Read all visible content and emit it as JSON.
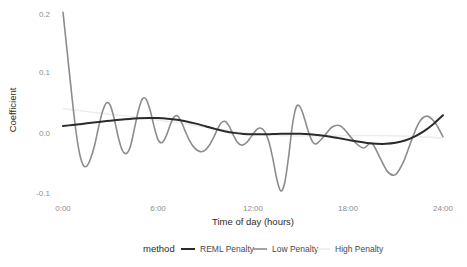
{
  "chart_data": {
    "type": "line",
    "title": "",
    "xlabel": "Time of day (hours)",
    "ylabel": "Coefficient",
    "xlim": [
      0,
      24
    ],
    "ylim": [
      -0.12,
      0.215
    ],
    "grid": false,
    "legend_position": "bottom",
    "legend_title": "method",
    "xticks": [
      0,
      6,
      12,
      18,
      24
    ],
    "xticklabels": [
      "0:00",
      "6:00",
      "12:00",
      "18:00",
      "24:00"
    ],
    "yticks": [
      -0.1,
      0.0,
      0.1,
      0.2
    ],
    "yticklabels": [
      "-0.1",
      "0.0",
      "0.1",
      "0.2"
    ],
    "series": [
      {
        "name": "REML Penalty",
        "color": "#2b2b2b",
        "width": 2.0,
        "x": [
          0.0,
          0.6,
          1.2,
          1.8,
          2.4,
          3.0,
          3.6,
          4.2,
          4.8,
          5.4,
          6.0,
          6.6,
          7.2,
          7.8,
          8.4,
          9.0,
          9.6,
          10.2,
          10.8,
          11.4,
          12.0,
          12.6,
          13.2,
          13.8,
          14.4,
          15.0,
          15.6,
          16.2,
          16.8,
          17.4,
          18.0,
          18.6,
          19.2,
          19.8,
          20.4,
          21.0,
          21.6,
          22.2,
          22.8,
          23.4,
          24.0
        ],
        "y": [
          0.0115,
          0.0133,
          0.0151,
          0.0169,
          0.0187,
          0.0205,
          0.0221,
          0.0234,
          0.0243,
          0.0248,
          0.0247,
          0.0238,
          0.022,
          0.0192,
          0.0155,
          0.0112,
          0.0068,
          0.003,
          0.0002,
          -0.0015,
          -0.0022,
          -0.0022,
          -0.0018,
          -0.0013,
          -0.0011,
          -0.0013,
          -0.0021,
          -0.0036,
          -0.0058,
          -0.0085,
          -0.0114,
          -0.0142,
          -0.0165,
          -0.0179,
          -0.018,
          -0.0163,
          -0.0124,
          -0.006,
          0.0031,
          0.015,
          0.0295
        ]
      },
      {
        "name": "Low Penalty",
        "color": "#8c8c8c",
        "width": 1.6,
        "x": [
          0.0,
          0.25,
          0.5,
          0.75,
          1.0,
          1.25,
          1.5,
          1.75,
          2.0,
          2.25,
          2.5,
          2.75,
          3.0,
          3.25,
          3.5,
          3.75,
          4.0,
          4.25,
          4.5,
          4.75,
          5.0,
          5.25,
          5.5,
          5.75,
          6.0,
          6.25,
          6.5,
          6.75,
          7.0,
          7.25,
          7.5,
          7.75,
          8.0,
          8.25,
          8.5,
          8.75,
          9.0,
          9.25,
          9.5,
          9.75,
          10.0,
          10.25,
          10.5,
          10.75,
          11.0,
          11.25,
          11.5,
          11.75,
          12.0,
          12.25,
          12.5,
          12.75,
          13.0,
          13.25,
          13.5,
          13.75,
          14.0,
          14.25,
          14.5,
          14.75,
          15.0,
          15.25,
          15.5,
          15.75,
          16.0,
          16.5,
          17.0,
          17.5,
          18.0,
          18.5,
          19.0,
          19.5,
          20.0,
          20.5,
          21.0,
          21.5,
          22.0,
          22.5,
          23.0,
          23.5,
          24.0
        ],
        "y": [
          0.2,
          0.138,
          0.076,
          0.017,
          -0.028,
          -0.052,
          -0.055,
          -0.042,
          -0.02,
          0.01,
          0.036,
          0.05,
          0.045,
          0.022,
          -0.008,
          -0.029,
          -0.034,
          -0.023,
          0.006,
          0.036,
          0.056,
          0.056,
          0.038,
          0.011,
          -0.011,
          -0.016,
          -0.006,
          0.012,
          0.026,
          0.028,
          0.017,
          0.001,
          -0.013,
          -0.023,
          -0.029,
          -0.031,
          -0.028,
          -0.02,
          -0.008,
          0.006,
          0.017,
          0.019,
          0.011,
          -0.003,
          -0.015,
          -0.02,
          -0.018,
          -0.011,
          -0.002,
          0.006,
          0.008,
          0.002,
          -0.014,
          -0.042,
          -0.076,
          -0.096,
          -0.083,
          -0.039,
          0.015,
          0.044,
          0.042,
          0.024,
          0.002,
          -0.014,
          -0.018,
          -0.005,
          0.01,
          0.012,
          -0.001,
          -0.017,
          -0.025,
          -0.017,
          -0.04,
          -0.064,
          -0.069,
          -0.048,
          -0.013,
          0.018,
          0.028,
          0.017,
          -0.006
        ]
      },
      {
        "name": "High Penalty",
        "color": "#ededed",
        "width": 1.6,
        "x": [
          0.0,
          1.0,
          2.0,
          3.0,
          4.0,
          5.0,
          6.0,
          7.0,
          8.0,
          9.0,
          10.0,
          11.0,
          12.0,
          13.0,
          14.0,
          15.0,
          16.0,
          17.0,
          18.0,
          19.0,
          20.0,
          21.0,
          22.0,
          23.0,
          24.0
        ],
        "y": [
          0.0405,
          0.0372,
          0.0341,
          0.0311,
          0.0281,
          0.0249,
          0.0214,
          0.0177,
          0.0137,
          0.0096,
          0.0056,
          0.002,
          -0.001,
          -0.0032,
          -0.0045,
          -0.005,
          -0.005,
          -0.0047,
          -0.0043,
          -0.0041,
          -0.0042,
          -0.0047,
          -0.0056,
          -0.0068,
          -0.0082
        ]
      }
    ]
  },
  "legend": {
    "title": "method",
    "entries": [
      {
        "label": "REML Penalty",
        "color": "#2b2b2b"
      },
      {
        "label": "Low Penalty",
        "color": "#8c8c8c"
      },
      {
        "label": "High Penalty",
        "color": "#ededed"
      }
    ]
  },
  "axes": {
    "x_title": "Time of day (hours)",
    "y_title": "Coefficient",
    "x_labels": [
      "0:00",
      "6:00",
      "12:00",
      "18:00",
      "24:00"
    ],
    "y_labels": [
      "0.2",
      "0.1",
      "0.0",
      "-0.1"
    ]
  },
  "colors": {
    "background": "#ffffff",
    "tick_text": "#8e8e8e",
    "title_text": "#2b2b2b"
  }
}
